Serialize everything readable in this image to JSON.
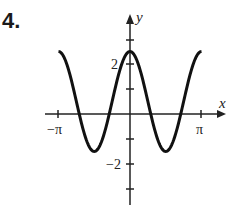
{
  "problem_number": "4.",
  "chart_data": {
    "type": "line",
    "title": "",
    "xlabel": "x",
    "ylabel": "y",
    "function": "y = 0.5 + 2cos(2x)",
    "xlim": [
      -3.14159,
      3.14159
    ],
    "ylim": [
      -3,
      3
    ],
    "x_tick_labels": [
      "−π",
      "π"
    ],
    "y_tick_labels": [
      "2",
      "−2"
    ],
    "y_ticks": [
      -3,
      -2,
      -1,
      1,
      2,
      3
    ],
    "max": 2.5,
    "min": -1.5,
    "period": 3.14159,
    "grid": false,
    "x": [
      -3.14,
      -2.36,
      -1.57,
      -0.79,
      0,
      0.79,
      1.57,
      2.36,
      3.14
    ],
    "series": [
      {
        "name": "curve",
        "values": [
          2.5,
          0.5,
          -1.5,
          0.5,
          2.5,
          0.5,
          -1.5,
          0.5,
          2.5
        ]
      }
    ]
  },
  "labels": {
    "x_axis": "x",
    "y_axis": "y",
    "neg_pi": "−π",
    "pos_pi": "π",
    "two": "2",
    "neg_two": "−2"
  }
}
